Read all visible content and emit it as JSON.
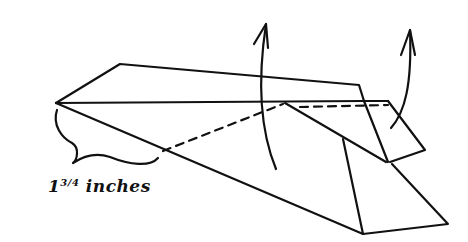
{
  "diagram": {
    "type": "paper-airplane-folding-step",
    "stroke_color": "#111111",
    "background": "#ffffff",
    "label": {
      "whole": "1",
      "fraction": "3/4",
      "unit": "inches"
    },
    "arrows": [
      {
        "name": "fold-up-arrow-wing",
        "direction": "up"
      },
      {
        "name": "fold-up-arrow-flap",
        "direction": "up"
      }
    ]
  }
}
